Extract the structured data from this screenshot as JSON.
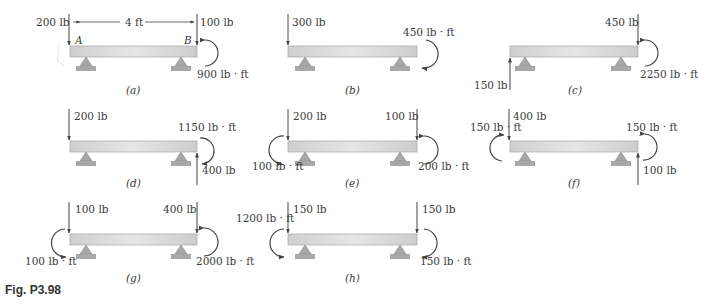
{
  "figure": {
    "caption": "Fig. P3.98",
    "dimension_label": "4 ft",
    "point_labels": {
      "A": "A",
      "B": "B"
    },
    "colors": {
      "beam_fill": "#d9d9d9",
      "beam_stroke": "#8a8a8a",
      "support": "#a8a8a8",
      "arrow": "#444444"
    }
  },
  "cases": [
    {
      "id": "a",
      "caption": "(a)",
      "left_force": "200 lb",
      "left_dir": "down",
      "right_force": "100 lb",
      "right_dir": "down",
      "moment": "900 lb · ft",
      "moment_side": "right",
      "moment_dir": "cw"
    },
    {
      "id": "b",
      "caption": "(b)",
      "left_force": "300 lb",
      "left_dir": "down",
      "moment": "450 lb · ft",
      "moment_side": "right",
      "moment_dir": "cw"
    },
    {
      "id": "c",
      "caption": "(c)",
      "left_force": "150 lb",
      "left_dir": "up",
      "right_force": "450 lb",
      "right_dir": "down",
      "moment": "2250 lb · ft",
      "moment_side": "right",
      "moment_dir": "cw"
    },
    {
      "id": "d",
      "caption": "(d)",
      "left_force": "200 lb",
      "left_dir": "down",
      "right_force": "400 lb",
      "right_dir": "up",
      "moment": "1150 lb · ft",
      "moment_side": "right",
      "moment_dir": "cw"
    },
    {
      "id": "e",
      "caption": "(e)",
      "left_force": "200 lb",
      "left_dir": "down",
      "right_force": "100 lb",
      "right_dir": "down",
      "left_moment": "100 lb · ft",
      "right_moment": "200 lb · ft"
    },
    {
      "id": "f",
      "caption": "(f)",
      "left_force": "400 lb",
      "left_dir": "down",
      "right_force": "100 lb",
      "right_dir": "up",
      "left_moment": "150 lb · ft",
      "right_moment": "150 lb · ft"
    },
    {
      "id": "g",
      "caption": "(g)",
      "left_force": "100 lb",
      "left_dir": "down",
      "right_force": "400 lb",
      "right_dir": "down",
      "left_moment": "100 lb · ft",
      "right_moment": "2000 lb · ft"
    },
    {
      "id": "h",
      "caption": "(h)",
      "left_force": "150 lb",
      "left_dir": "down",
      "right_force": "150 lb",
      "right_dir": "down",
      "left_moment": "1200 lb · ft",
      "right_moment": "150 lb · ft"
    }
  ]
}
